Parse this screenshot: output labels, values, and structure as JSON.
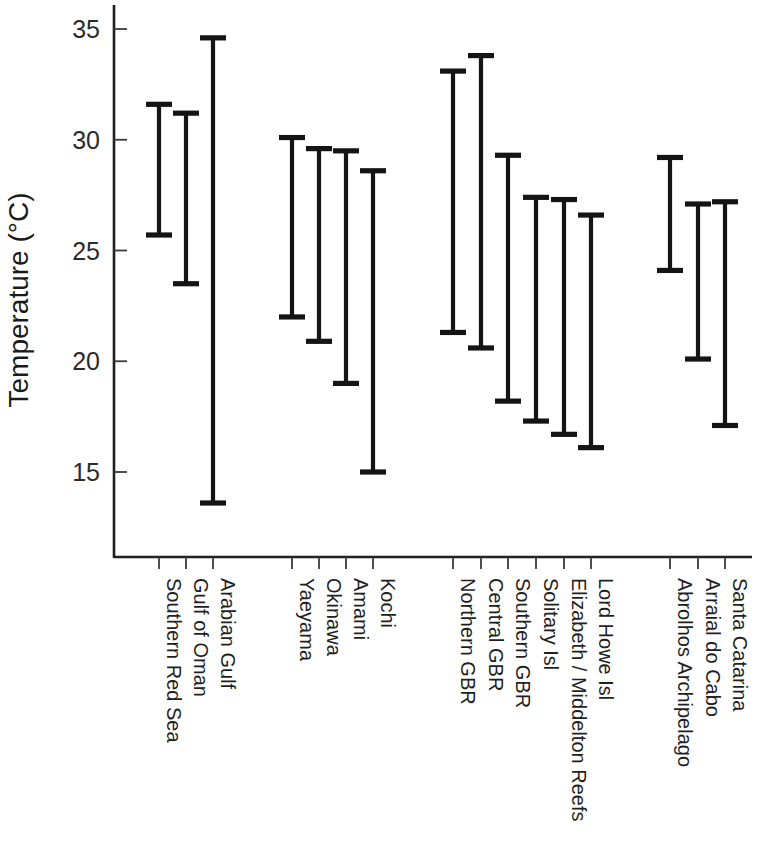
{
  "chart_data": {
    "type": "range",
    "title": "",
    "xlabel": "",
    "ylabel": "Temperature (°C)",
    "ylim": [
      12.0,
      36.0
    ],
    "yticks": [
      15,
      20,
      25,
      30,
      35
    ],
    "ytick_labels": [
      "15",
      "20",
      "25",
      "30",
      "35"
    ],
    "grid": false,
    "legend": "none",
    "series_note": "Vertical capped bars show minimum and maximum temperature at each location",
    "groups": [
      {
        "name": "Arabian region",
        "points": [
          {
            "category": "Southern Red Sea",
            "min": 25.7,
            "max": 31.6
          },
          {
            "category": "Gulf of Oman",
            "min": 23.5,
            "max": 31.2
          },
          {
            "category": "Arabian Gulf",
            "min": 13.6,
            "max": 34.6
          }
        ]
      },
      {
        "name": "Japan region",
        "points": [
          {
            "category": "Yaeyama",
            "min": 22.0,
            "max": 30.1
          },
          {
            "category": "Okinawa",
            "min": 20.9,
            "max": 29.6
          },
          {
            "category": "Amami",
            "min": 19.0,
            "max": 29.5
          },
          {
            "category": "Kochi",
            "min": 15.0,
            "max": 28.6
          }
        ]
      },
      {
        "name": "Australia region",
        "points": [
          {
            "category": "Northern GBR",
            "min": 21.3,
            "max": 33.1
          },
          {
            "category": "Central GBR",
            "min": 20.6,
            "max": 33.8
          },
          {
            "category": "Southern GBR",
            "min": 18.2,
            "max": 29.3
          },
          {
            "category": "Solitary Isl",
            "min": 17.3,
            "max": 27.4
          },
          {
            "category": "Elizabeth / Middelton Reefs",
            "min": 16.7,
            "max": 27.3
          },
          {
            "category": "Lord Howe Isl",
            "min": 16.1,
            "max": 26.6
          }
        ]
      },
      {
        "name": "Brazil region",
        "points": [
          {
            "category": "Abrolhos Archipelago",
            "min": 24.1,
            "max": 29.2
          },
          {
            "category": "Arraial do Cabo",
            "min": 20.1,
            "max": 27.1
          },
          {
            "category": "Santa Catarina",
            "min": 17.1,
            "max": 27.2
          }
        ]
      }
    ],
    "colors": {
      "bar": "#141414",
      "axis": "#1f1f1f",
      "text": "#1a1a1a",
      "background": "#ffffff"
    }
  },
  "layout": {
    "plot_left": 114,
    "plot_right": 752,
    "plot_top": 5,
    "plot_bottom": 557,
    "y_of_35": 29,
    "px_per_degree": 22.15,
    "x_positions": [
      159,
      186,
      213,
      292,
      319,
      346,
      373,
      453,
      481,
      508,
      536,
      564,
      591,
      670,
      698,
      725
    ],
    "label_top": 578
  }
}
